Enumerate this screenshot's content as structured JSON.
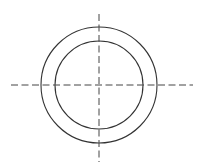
{
  "drawing": {
    "type": "concentric-circles-with-centerlines",
    "width": 202,
    "height": 168,
    "center": {
      "x": 99,
      "y": 85
    },
    "outer_circle": {
      "r": 58
    },
    "inner_circle": {
      "r": 44
    },
    "horizontal_centerline": {
      "x1": 11,
      "x2": 193,
      "y": 85
    },
    "vertical_centerline": {
      "x": 99,
      "y1": 14,
      "y2": 162
    },
    "colors": {
      "stroke": "#333333",
      "background": "#ffffff"
    }
  }
}
